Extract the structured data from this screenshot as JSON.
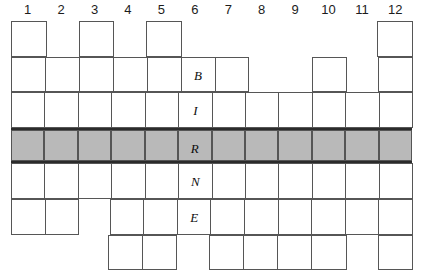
{
  "puzzle": {
    "title": "BINGO-style crossword grid",
    "columns": 12,
    "rows": 7,
    "column_headers": [
      "1",
      "2",
      "3",
      "4",
      "5",
      "6",
      "7",
      "8",
      "9",
      "10",
      "11",
      "12"
    ],
    "keyword_column": 6,
    "keyword": "BIRNE",
    "shaded_row_index": 4,
    "colors": {
      "cell_border": "#565656",
      "cell_fill": "#ffffff",
      "shaded_fill": "#b9b9b9",
      "shaded_border": "#2b2b2b",
      "text": "#111111",
      "background": "#ffffff"
    },
    "rows_data": [
      {
        "index": 1,
        "shaded": false,
        "cells": [
          {
            "col": 1,
            "present": true,
            "letter": ""
          },
          {
            "col": 2,
            "present": false,
            "letter": ""
          },
          {
            "col": 3,
            "present": true,
            "letter": ""
          },
          {
            "col": 4,
            "present": false,
            "letter": ""
          },
          {
            "col": 5,
            "present": true,
            "letter": ""
          },
          {
            "col": 6,
            "present": false,
            "letter": ""
          },
          {
            "col": 7,
            "present": false,
            "letter": ""
          },
          {
            "col": 8,
            "present": false,
            "letter": ""
          },
          {
            "col": 9,
            "present": false,
            "letter": ""
          },
          {
            "col": 10,
            "present": false,
            "letter": ""
          },
          {
            "col": 11,
            "present": false,
            "letter": ""
          },
          {
            "col": 12,
            "present": true,
            "letter": ""
          }
        ]
      },
      {
        "index": 2,
        "shaded": false,
        "cells": [
          {
            "col": 1,
            "present": true,
            "letter": ""
          },
          {
            "col": 2,
            "present": true,
            "letter": ""
          },
          {
            "col": 3,
            "present": true,
            "letter": ""
          },
          {
            "col": 4,
            "present": true,
            "letter": ""
          },
          {
            "col": 5,
            "present": true,
            "letter": ""
          },
          {
            "col": 6,
            "present": true,
            "letter": "B"
          },
          {
            "col": 7,
            "present": true,
            "letter": ""
          },
          {
            "col": 8,
            "present": false,
            "letter": ""
          },
          {
            "col": 9,
            "present": false,
            "letter": ""
          },
          {
            "col": 10,
            "present": true,
            "letter": ""
          },
          {
            "col": 11,
            "present": false,
            "letter": ""
          },
          {
            "col": 12,
            "present": true,
            "letter": ""
          }
        ]
      },
      {
        "index": 3,
        "shaded": false,
        "cells": [
          {
            "col": 1,
            "present": true,
            "letter": ""
          },
          {
            "col": 2,
            "present": true,
            "letter": ""
          },
          {
            "col": 3,
            "present": true,
            "letter": ""
          },
          {
            "col": 4,
            "present": true,
            "letter": ""
          },
          {
            "col": 5,
            "present": true,
            "letter": ""
          },
          {
            "col": 6,
            "present": true,
            "letter": "I"
          },
          {
            "col": 7,
            "present": true,
            "letter": ""
          },
          {
            "col": 8,
            "present": true,
            "letter": ""
          },
          {
            "col": 9,
            "present": true,
            "letter": ""
          },
          {
            "col": 10,
            "present": true,
            "letter": ""
          },
          {
            "col": 11,
            "present": true,
            "letter": ""
          },
          {
            "col": 12,
            "present": true,
            "letter": ""
          }
        ]
      },
      {
        "index": 4,
        "shaded": true,
        "cells": [
          {
            "col": 1,
            "present": true,
            "letter": ""
          },
          {
            "col": 2,
            "present": true,
            "letter": ""
          },
          {
            "col": 3,
            "present": true,
            "letter": ""
          },
          {
            "col": 4,
            "present": true,
            "letter": ""
          },
          {
            "col": 5,
            "present": true,
            "letter": ""
          },
          {
            "col": 6,
            "present": true,
            "letter": "R"
          },
          {
            "col": 7,
            "present": true,
            "letter": ""
          },
          {
            "col": 8,
            "present": true,
            "letter": ""
          },
          {
            "col": 9,
            "present": true,
            "letter": ""
          },
          {
            "col": 10,
            "present": true,
            "letter": ""
          },
          {
            "col": 11,
            "present": true,
            "letter": ""
          },
          {
            "col": 12,
            "present": true,
            "letter": ""
          }
        ]
      },
      {
        "index": 5,
        "shaded": false,
        "cells": [
          {
            "col": 1,
            "present": true,
            "letter": ""
          },
          {
            "col": 2,
            "present": true,
            "letter": ""
          },
          {
            "col": 3,
            "present": true,
            "letter": ""
          },
          {
            "col": 4,
            "present": true,
            "letter": ""
          },
          {
            "col": 5,
            "present": true,
            "letter": ""
          },
          {
            "col": 6,
            "present": true,
            "letter": "N"
          },
          {
            "col": 7,
            "present": true,
            "letter": ""
          },
          {
            "col": 8,
            "present": true,
            "letter": ""
          },
          {
            "col": 9,
            "present": true,
            "letter": ""
          },
          {
            "col": 10,
            "present": true,
            "letter": ""
          },
          {
            "col": 11,
            "present": true,
            "letter": ""
          },
          {
            "col": 12,
            "present": true,
            "letter": ""
          }
        ]
      },
      {
        "index": 6,
        "shaded": false,
        "cells": [
          {
            "col": 1,
            "present": true,
            "letter": ""
          },
          {
            "col": 2,
            "present": true,
            "letter": ""
          },
          {
            "col": 3,
            "present": false,
            "letter": ""
          },
          {
            "col": 4,
            "present": true,
            "letter": ""
          },
          {
            "col": 5,
            "present": true,
            "letter": ""
          },
          {
            "col": 6,
            "present": true,
            "letter": "E"
          },
          {
            "col": 7,
            "present": true,
            "letter": ""
          },
          {
            "col": 8,
            "present": true,
            "letter": ""
          },
          {
            "col": 9,
            "present": true,
            "letter": ""
          },
          {
            "col": 10,
            "present": true,
            "letter": ""
          },
          {
            "col": 11,
            "present": true,
            "letter": ""
          },
          {
            "col": 12,
            "present": true,
            "letter": ""
          }
        ]
      },
      {
        "index": 7,
        "shaded": false,
        "cells": [
          {
            "col": 1,
            "present": false,
            "letter": ""
          },
          {
            "col": 2,
            "present": false,
            "letter": ""
          },
          {
            "col": 3,
            "present": false,
            "letter": ""
          },
          {
            "col": 4,
            "present": true,
            "letter": ""
          },
          {
            "col": 5,
            "present": true,
            "letter": ""
          },
          {
            "col": 6,
            "present": false,
            "letter": ""
          },
          {
            "col": 7,
            "present": true,
            "letter": ""
          },
          {
            "col": 8,
            "present": true,
            "letter": ""
          },
          {
            "col": 9,
            "present": true,
            "letter": ""
          },
          {
            "col": 10,
            "present": true,
            "letter": ""
          },
          {
            "col": 11,
            "present": false,
            "letter": ""
          },
          {
            "col": 12,
            "present": true,
            "letter": ""
          }
        ]
      }
    ]
  }
}
